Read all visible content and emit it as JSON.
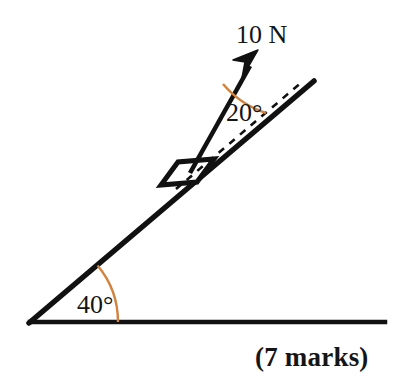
{
  "figure": {
    "kind": "inclined-plane-force-diagram",
    "background_color": "#ffffff",
    "line_color": "#111111",
    "arc_color": "#D2823C",
    "text_color": "#151515"
  },
  "labels": {
    "force": "10 N",
    "incline_angle": "40°",
    "force_angle": "20°",
    "marks": "(7 marks)"
  },
  "geometry": {
    "ground": {
      "x1": 30,
      "y1": 322,
      "x2": 385,
      "y2": 322
    },
    "incline": {
      "x1": 30,
      "y1": 322,
      "x2": 313,
      "y2": 82
    },
    "incline_angle_deg": 40,
    "force_vector": {
      "x1": 190,
      "y1": 172,
      "x2": 256,
      "y2": 54
    },
    "force_angle_from_incline_deg": 20,
    "dashed_reference": {
      "x1": 182,
      "y1": 184,
      "x2": 300,
      "y2": 84
    },
    "block": {
      "corners": "163,183 179,163 215,160 199,181",
      "center_x": 188,
      "center_y": 172
    },
    "arc_40": {
      "cx": 30,
      "cy": 322,
      "radius": 88
    },
    "arc_20": {
      "cx": 190,
      "cy": 172,
      "radius": 96
    }
  },
  "text_positions": {
    "force": {
      "x": 236,
      "y": 43
    },
    "incline_angle": {
      "x": 77,
      "y": 313
    },
    "force_angle": {
      "x": 226,
      "y": 121
    },
    "marks": {
      "x": 255,
      "y": 366
    }
  }
}
